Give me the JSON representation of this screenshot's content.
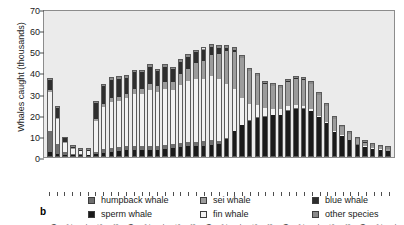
{
  "chart_data": {
    "type": "bar",
    "stacked": true,
    "title": "",
    "panel_label": "b",
    "xlabel": "",
    "ylabel": "Whales caught (thousands)",
    "ylim": [
      0,
      70
    ],
    "yticks": [
      0,
      10,
      20,
      30,
      40,
      50,
      60,
      70
    ],
    "grid": false,
    "legend_position": "bottom",
    "x": [
      1940,
      1941,
      1942,
      1943,
      1944,
      1945,
      1946,
      1947,
      1948,
      1949,
      1950,
      1951,
      1952,
      1953,
      1954,
      1955,
      1956,
      1957,
      1958,
      1959,
      1960,
      1961,
      1962,
      1963,
      1964,
      1965,
      1966,
      1967,
      1968,
      1969,
      1970,
      1971,
      1972,
      1973,
      1974,
      1975,
      1976,
      1977,
      1978,
      1979,
      1980,
      1981,
      1982,
      1983,
      1984
    ],
    "tick_labels": [
      "1940",
      "",
      "1942",
      "",
      "1944",
      "",
      "1946",
      "",
      "1948",
      "",
      "1950",
      "",
      "1952",
      "",
      "1954",
      "",
      "1956",
      "",
      "1958",
      "",
      "1960",
      "",
      "1962",
      "",
      "1964",
      "",
      "1966",
      "",
      "1968",
      "",
      "1970",
      "",
      "1972",
      "",
      "1974",
      "",
      "1976",
      "",
      "1978",
      "",
      "1980",
      "",
      "1982",
      "",
      "1984"
    ],
    "series": [
      {
        "name": "sperm whale",
        "color": "#1a1a1a",
        "values": [
          2.0,
          1.0,
          0.5,
          0.4,
          0.4,
          0.4,
          1.0,
          1.6,
          2.0,
          2.5,
          3.0,
          3.0,
          3.0,
          3.0,
          3.0,
          3.5,
          4.0,
          4.5,
          5.0,
          5.0,
          5.0,
          5.5,
          6.0,
          8.0,
          12.0,
          15.0,
          17.0,
          18.5,
          19.0,
          20.0,
          20.0,
          22.0,
          23.0,
          23.0,
          22.0,
          19.0,
          16.0,
          12.0,
          10.0,
          8.0,
          6.0,
          5.0,
          4.0,
          3.5,
          3.0
        ]
      },
      {
        "name": "humpback whale",
        "color": "#6e6e6e",
        "values": [
          10.0,
          5.0,
          1.5,
          0.8,
          0.6,
          0.5,
          1.0,
          2.0,
          2.0,
          2.0,
          2.0,
          2.0,
          2.0,
          2.0,
          2.0,
          2.0,
          2.0,
          2.0,
          2.0,
          2.0,
          2.0,
          2.0,
          1.0,
          0.5,
          0.3,
          0.2,
          0.2,
          0.2,
          0.2,
          0.1,
          0.1,
          0.1,
          0.1,
          0.1,
          0.1,
          0.1,
          0.1,
          0.1,
          0.1,
          0.1,
          0.1,
          0.1,
          0.1,
          0.1,
          0.1
        ]
      },
      {
        "name": "fin whale",
        "color": "#f2f2f2",
        "values": [
          19.0,
          12.0,
          5.0,
          3.0,
          2.0,
          2.0,
          15.0,
          20.0,
          22.0,
          22.0,
          23.0,
          25.0,
          25.0,
          27.0,
          26.0,
          27.0,
          26.0,
          28.0,
          29.0,
          30.0,
          30.0,
          31.0,
          30.0,
          26.0,
          20.0,
          13.0,
          8.0,
          6.0,
          4.0,
          3.0,
          3.0,
          2.0,
          1.5,
          1.0,
          0.8,
          0.6,
          0.5,
          0.4,
          0.3,
          0.2,
          0.2,
          0.1,
          0.1,
          0.1,
          0.1
        ]
      },
      {
        "name": "sei whale",
        "color": "#9c9c9c",
        "values": [
          1.0,
          0.6,
          0.3,
          0.2,
          0.2,
          0.2,
          1.0,
          1.5,
          2.0,
          2.0,
          2.0,
          2.5,
          2.5,
          3.0,
          3.0,
          3.5,
          4.0,
          5.0,
          6.0,
          8.0,
          9.0,
          10.0,
          12.0,
          16.0,
          18.0,
          19.0,
          16.0,
          14.0,
          12.0,
          11.0,
          10.0,
          12.0,
          13.0,
          13.0,
          12.0,
          10.0,
          8.0,
          6.0,
          4.0,
          3.0,
          2.5,
          2.0,
          1.5,
          1.2,
          1.0
        ]
      },
      {
        "name": "blue whale",
        "color": "#2e2e2e",
        "values": [
          5.0,
          5.0,
          2.0,
          1.0,
          0.8,
          0.8,
          8.0,
          9.0,
          9.0,
          9.0,
          8.0,
          8.0,
          8.0,
          8.0,
          7.0,
          7.0,
          6.0,
          6.0,
          6.0,
          5.0,
          5.0,
          4.0,
          3.0,
          1.5,
          0.8,
          0.3,
          0.1,
          0.1,
          0.1,
          0.1,
          0.1,
          0.1,
          0.1,
          0.1,
          0.1,
          0.1,
          0.1,
          0.1,
          0.1,
          0.1,
          0.1,
          0.1,
          0.1,
          0.1,
          0.1
        ]
      },
      {
        "name": "other species",
        "color": "#8a8a8a",
        "values": [
          0.5,
          0.4,
          0.2,
          0.2,
          0.2,
          0.2,
          0.5,
          0.6,
          0.8,
          0.8,
          0.8,
          0.8,
          0.8,
          0.8,
          0.8,
          0.8,
          0.8,
          0.8,
          0.8,
          0.8,
          0.8,
          0.8,
          0.8,
          0.8,
          0.8,
          0.8,
          0.8,
          0.8,
          0.8,
          0.8,
          0.8,
          0.8,
          0.8,
          0.8,
          0.8,
          0.8,
          0.8,
          0.8,
          0.8,
          0.8,
          0.8,
          0.8,
          0.8,
          0.8,
          0.8
        ]
      }
    ],
    "legend": [
      {
        "label": "humpback whale",
        "color": "#6e6e6e"
      },
      {
        "label": "sei whale",
        "color": "#9c9c9c"
      },
      {
        "label": "blue whale",
        "color": "#2e2e2e"
      },
      {
        "label": "sperm whale",
        "color": "#1a1a1a"
      },
      {
        "label": "fin whale",
        "color": "#f2f2f2"
      },
      {
        "label": "other species",
        "color": "#8a8a8a"
      }
    ]
  }
}
